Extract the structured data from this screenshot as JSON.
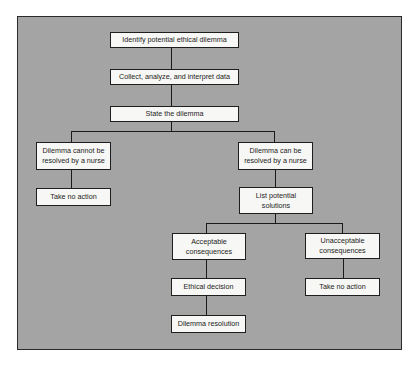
{
  "diagram": {
    "type": "flowchart",
    "colors": {
      "background": "#a4a4a4",
      "box_fill": "#f7f7f5",
      "line": "#1a1a1a"
    },
    "nodes": {
      "identify": "Identify potential ethical dilemma",
      "collect": "Collect, analyze, and interpret data",
      "state": "State the dilemma",
      "cannot": "Dilemma cannot be resolved by a nurse",
      "no_action_left": "Take no action",
      "can": "Dilemma can be resolved by a nurse",
      "list": "List potential solutions",
      "acceptable": "Acceptable consequences",
      "unacceptable": "Unacceptable consequences",
      "ethical": "Ethical decision",
      "no_action_right": "Take no action",
      "resolution": "Dilemma resolution"
    },
    "edges": [
      [
        "identify",
        "collect"
      ],
      [
        "collect",
        "state"
      ],
      [
        "state",
        "cannot"
      ],
      [
        "state",
        "can"
      ],
      [
        "cannot",
        "no_action_left"
      ],
      [
        "can",
        "list"
      ],
      [
        "list",
        "acceptable"
      ],
      [
        "list",
        "unacceptable"
      ],
      [
        "acceptable",
        "ethical"
      ],
      [
        "ethical",
        "resolution"
      ],
      [
        "unacceptable",
        "no_action_right"
      ]
    ]
  }
}
